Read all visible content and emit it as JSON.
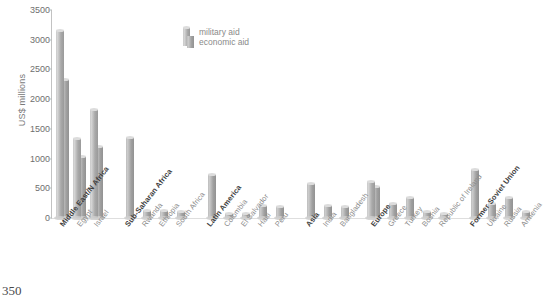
{
  "page_number": "350",
  "legend": {
    "position": "inside-top-center",
    "items": [
      {
        "key": "military",
        "label": "military aid",
        "icon": "bar-swatch-icon"
      },
      {
        "key": "economic",
        "label": "economic aid",
        "icon": "bar-swatch-icon"
      }
    ]
  },
  "chart_data": {
    "type": "bar",
    "title": "",
    "subtitle": "",
    "xlabel": "",
    "ylabel": "US$ millions",
    "ylim": [
      0,
      3500
    ],
    "yticks": [
      0,
      500,
      1000,
      1500,
      2000,
      2500,
      3000,
      3500
    ],
    "ytick_labels": [
      "0",
      "500",
      "1000",
      "1500",
      "2000",
      "2500",
      "3000",
      "3500"
    ],
    "grid": false,
    "legend_position": "inside-top-center",
    "series": [
      {
        "name": "military aid",
        "color": "#b4b4b4"
      },
      {
        "name": "economic aid",
        "color": "#a8a8a8"
      }
    ],
    "categories": [
      "Middle East/N Africa",
      "Egypt",
      "Israel",
      "Sub-Saharan Africa",
      "Rwanda",
      "Ethiopia",
      "South Africa",
      "Latin America",
      "Colombia",
      "El Salvador",
      "Haiti",
      "Peru",
      "Asia",
      "India",
      "Bangladesh",
      "Europe",
      "Greece",
      "Turkey",
      "Bosnia",
      "Republic of Ireland",
      "Former Soviet Union",
      "Ukraine",
      "Russia",
      "Armenia"
    ],
    "groups": [
      {
        "region": "Middle East/N Africa",
        "bars": [
          {
            "label": "Middle East/N Africa",
            "is_region": true,
            "military": 3150,
            "economic": 2330
          },
          {
            "label": "Egypt",
            "is_region": false,
            "military": 1330,
            "economic": 1020
          },
          {
            "label": "Israel",
            "is_region": false,
            "military": 1820,
            "economic": 1200
          }
        ]
      },
      {
        "region": "Sub-Saharan Africa",
        "bars": [
          {
            "label": "Sub-Saharan Africa",
            "is_region": true,
            "military": 0,
            "economic": 1340
          },
          {
            "label": "Rwanda",
            "is_region": false,
            "military": 0,
            "economic": 120
          },
          {
            "label": "Ethiopia",
            "is_region": false,
            "military": 0,
            "economic": 110
          },
          {
            "label": "South Africa",
            "is_region": false,
            "military": 0,
            "economic": 100
          }
        ]
      },
      {
        "region": "Latin America",
        "bars": [
          {
            "label": "Latin America",
            "is_region": true,
            "military": 0,
            "economic": 720
          },
          {
            "label": "Colombia",
            "is_region": false,
            "military": 0,
            "economic": 60
          },
          {
            "label": "El Salvador",
            "is_region": false,
            "military": 0,
            "economic": 70
          },
          {
            "label": "Haiti",
            "is_region": false,
            "military": 0,
            "economic": 200
          },
          {
            "label": "Peru",
            "is_region": false,
            "military": 0,
            "economic": 185
          }
        ]
      },
      {
        "region": "Asia",
        "bars": [
          {
            "label": "Asia",
            "is_region": true,
            "military": 0,
            "economic": 580
          },
          {
            "label": "India",
            "is_region": false,
            "military": 0,
            "economic": 200
          },
          {
            "label": "Bangladesh",
            "is_region": false,
            "military": 0,
            "economic": 190
          }
        ]
      },
      {
        "region": "Europe",
        "bars": [
          {
            "label": "Europe",
            "is_region": true,
            "military": 600,
            "economic": 520
          },
          {
            "label": "Greece",
            "is_region": false,
            "military": 0,
            "economic": 230
          },
          {
            "label": "Turkey",
            "is_region": false,
            "military": 0,
            "economic": 330
          },
          {
            "label": "Bosnia",
            "is_region": false,
            "military": 0,
            "economic": 100
          },
          {
            "label": "Republic of Ireland",
            "is_region": false,
            "military": 0,
            "economic": 70
          }
        ]
      },
      {
        "region": "Former Soviet Union",
        "bars": [
          {
            "label": "Former Soviet Union",
            "is_region": true,
            "military": 0,
            "economic": 810
          },
          {
            "label": "Ukraine",
            "is_region": false,
            "military": 0,
            "economic": 230
          },
          {
            "label": "Russia",
            "is_region": false,
            "military": 0,
            "economic": 330
          },
          {
            "label": "Armenia",
            "is_region": false,
            "military": 0,
            "economic": 100
          }
        ]
      }
    ]
  },
  "colors": {
    "bar_light": "#d5d5d5",
    "bar_dark": "#9a9a9a",
    "axis": "#c2c2c2",
    "tick_text": "#6e6e6e",
    "region_label": "#3d3d3d",
    "country_label": "#8c8c8c"
  }
}
